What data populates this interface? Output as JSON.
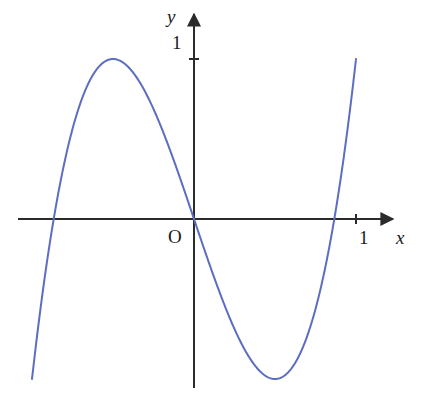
{
  "figure": {
    "title": "",
    "background_color": "#ffffff",
    "width": 425,
    "height": 395
  },
  "axes": {
    "x_axis": {
      "label": "x",
      "arrow": true,
      "color": "#2b2b2b",
      "tick_labels": [
        "1"
      ],
      "tick_values": [
        1
      ]
    },
    "y_axis": {
      "label": "y",
      "arrow": true,
      "color": "#2b2b2b",
      "tick_labels": [
        "1"
      ],
      "tick_values": [
        1
      ]
    },
    "origin_label": "O"
  },
  "chart_data": {
    "type": "line",
    "title": "",
    "xlabel": "x",
    "ylabel": "y",
    "xlim": [
      -1.0,
      1.0
    ],
    "ylim": [
      -1.0,
      1.0
    ],
    "grid": false,
    "legend": false,
    "curve_color": "#5b6ec0",
    "curve_width": 2,
    "parametric": {
      "x_expression": "cos(t)",
      "y_expression": "cos(3t)",
      "t_range": [
        0,
        6.283185307179586
      ]
    },
    "key_points": [
      {
        "label": "left-extreme",
        "x": -1.0,
        "y": 0.0
      },
      {
        "label": "left-upper-peak",
        "x": -0.86,
        "y": 1.0
      },
      {
        "label": "left-zero-crossing",
        "x": -0.475,
        "y": 0.0
      },
      {
        "label": "center-upper-peak",
        "x": 0.0,
        "y": 1.0
      },
      {
        "label": "right-zero-crossing",
        "x": 0.47,
        "y": 0.0
      },
      {
        "label": "right-upper-peak",
        "x": 0.83,
        "y": 1.0
      },
      {
        "label": "right-extreme",
        "x": 1.0,
        "y": 0.0
      },
      {
        "label": "center-lower-trough",
        "x": 0.0,
        "y": -1.0
      },
      {
        "label": "left-lower-trough",
        "x": -0.86,
        "y": -1.0
      },
      {
        "label": "right-lower-trough",
        "x": 0.83,
        "y": -1.0
      }
    ],
    "series": [
      {
        "name": "lissajous",
        "x": [
          -1.0,
          -0.98,
          -0.95,
          -0.92,
          -0.89,
          -0.86,
          -0.83,
          -0.8,
          -0.76,
          -0.72,
          -0.68,
          -0.64,
          -0.6,
          -0.56,
          -0.52,
          -0.475,
          -0.43,
          -0.39,
          -0.34,
          -0.3,
          -0.25,
          -0.2,
          -0.15,
          -0.1,
          -0.05,
          0.0,
          0.05,
          0.1,
          0.15,
          0.2,
          0.25,
          0.3,
          0.34,
          0.39,
          0.43,
          0.47,
          0.52,
          0.56,
          0.6,
          0.64,
          0.68,
          0.72,
          0.76,
          0.8,
          0.83,
          0.86,
          0.89,
          0.92,
          0.95,
          0.98,
          1.0
        ],
        "y_upper": [
          0.0,
          0.35,
          0.62,
          0.8,
          0.93,
          1.0,
          0.98,
          0.9,
          0.76,
          0.6,
          0.43,
          0.26,
          0.1,
          -0.05,
          -0.2,
          0.0,
          0.2,
          0.36,
          0.53,
          0.65,
          0.77,
          0.86,
          0.93,
          0.97,
          0.99,
          1.0,
          0.99,
          0.97,
          0.93,
          0.86,
          0.77,
          0.65,
          0.53,
          0.36,
          0.2,
          0.0,
          0.2,
          0.36,
          0.5,
          0.64,
          0.77,
          0.87,
          0.95,
          0.99,
          1.0,
          0.96,
          0.87,
          0.72,
          0.5,
          0.25,
          0.0
        ]
      }
    ]
  }
}
